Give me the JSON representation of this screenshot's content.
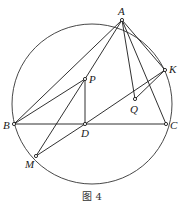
{
  "figure": {
    "caption": "图 4",
    "circle": {
      "cx": 92,
      "cy": 104,
      "r": 80
    },
    "points": {
      "A": {
        "label": "A",
        "x": 122,
        "y": 20,
        "lx": 118,
        "ly": 15
      },
      "K": {
        "label": "K",
        "x": 165,
        "y": 70,
        "lx": 169,
        "ly": 73
      },
      "P": {
        "label": "P",
        "x": 85,
        "y": 79,
        "lx": 89,
        "ly": 83
      },
      "Q": {
        "label": "Q",
        "x": 135,
        "y": 99,
        "lx": 130,
        "ly": 113
      },
      "B": {
        "label": "B",
        "x": 14,
        "y": 124,
        "lx": 3,
        "ly": 129
      },
      "D": {
        "label": "D",
        "x": 85,
        "y": 124,
        "lx": 81,
        "ly": 137
      },
      "C": {
        "label": "C",
        "x": 166,
        "y": 124,
        "lx": 170,
        "ly": 129
      },
      "M": {
        "label": "M",
        "x": 36,
        "y": 156,
        "lx": 25,
        "ly": 168
      }
    },
    "segments": [
      [
        "A",
        "B"
      ],
      [
        "A",
        "P"
      ],
      [
        "A",
        "Q"
      ],
      [
        "A",
        "C"
      ],
      [
        "A",
        "K"
      ],
      [
        "B",
        "C"
      ],
      [
        "B",
        "P"
      ],
      [
        "P",
        "D"
      ],
      [
        "P",
        "M"
      ],
      [
        "M",
        "D"
      ],
      [
        "D",
        "K"
      ],
      [
        "Q",
        "K"
      ]
    ]
  }
}
